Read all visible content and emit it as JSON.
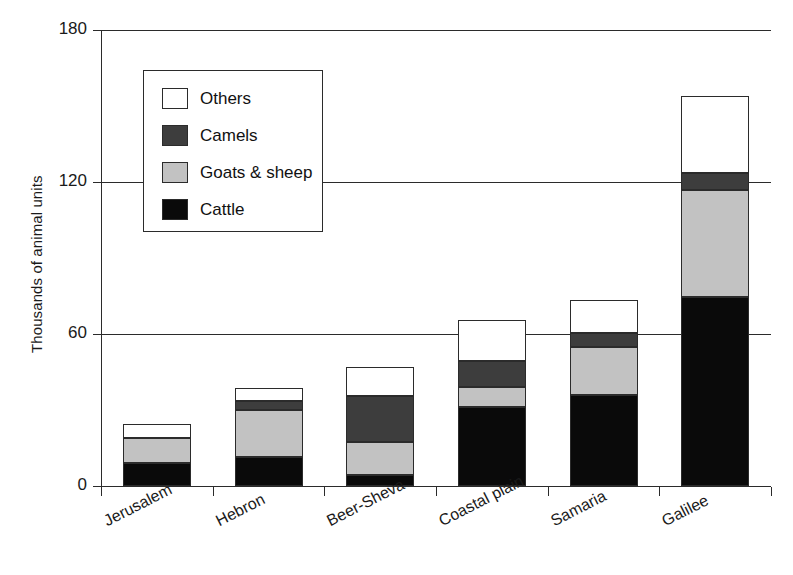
{
  "chart_data": {
    "type": "bar",
    "stacked": true,
    "title": "",
    "xlabel": "",
    "ylabel": "Thousands of animal units",
    "ylim": [
      0,
      180
    ],
    "yticks": [
      0,
      60,
      120,
      180
    ],
    "ytick_labels": [
      "0",
      "60",
      "120",
      "180"
    ],
    "grid": "horizontal",
    "legend_position": "upper-left-inside",
    "categories": [
      "Jerusalem",
      "Hebron",
      "Beer-Sheva",
      "Coastal plain",
      "Samaria",
      "Galilee"
    ],
    "series": [
      {
        "name": "Cattle",
        "color": "#0a0a0a",
        "values": [
          9,
          11.5,
          4.5,
          31,
          36,
          74.5
        ]
      },
      {
        "name": "Goats & sheep",
        "color": "#c2c2c2",
        "values": [
          10,
          18.5,
          13,
          8,
          19,
          42.5
        ]
      },
      {
        "name": "Camels",
        "color": "#3d3d3d",
        "values": [
          0,
          3.5,
          18,
          10.5,
          5.5,
          6.5
        ]
      },
      {
        "name": "Others",
        "color": "#ffffff",
        "values": [
          5.5,
          5,
          11.5,
          16,
          13,
          30.5
        ]
      }
    ],
    "totals": [
      24.5,
      38.5,
      47,
      65.5,
      73.5,
      154
    ],
    "legend_entries": [
      "Others",
      "Camels",
      "Goats & sheep",
      "Cattle"
    ]
  },
  "legend": {
    "items": [
      {
        "label": "Others",
        "color": "#ffffff"
      },
      {
        "label": "Camels",
        "color": "#3d3d3d"
      },
      {
        "label": "Goats & sheep",
        "color": "#c2c2c2"
      },
      {
        "label": "Cattle",
        "color": "#0a0a0a"
      }
    ]
  },
  "axes": {
    "y_title": "Thousands of animal units",
    "y_labels": [
      "180",
      "120",
      "60",
      "0"
    ],
    "x_labels": [
      "Jerusalem",
      "Hebron",
      "Beer-Sheva",
      "Coastal plain",
      "Samaria",
      "Galilee"
    ]
  }
}
